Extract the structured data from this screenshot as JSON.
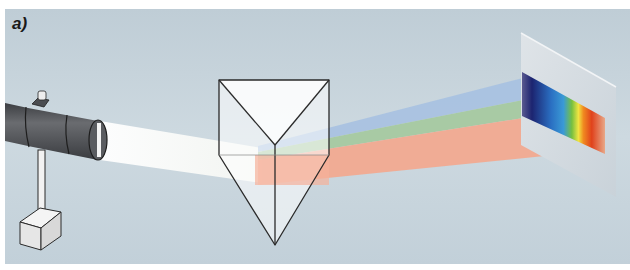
{
  "figure": {
    "label": "a)",
    "colors": {
      "background": "#c3d1da",
      "white_beam": "#fbfbf5",
      "blue_beam": "#a9c2e0",
      "green_beam": "#a5c9a0",
      "red_beam": "#f3a88e",
      "screen": "#d3dbe1",
      "lamp_body": "#505256"
    },
    "spectrum_stops": [
      "#3a3a7a",
      "#1e2a78",
      "#2c6fc0",
      "#3aa0d8",
      "#7cc23a",
      "#f2e640",
      "#f07a1a",
      "#e0401c",
      "#e8a080"
    ]
  }
}
